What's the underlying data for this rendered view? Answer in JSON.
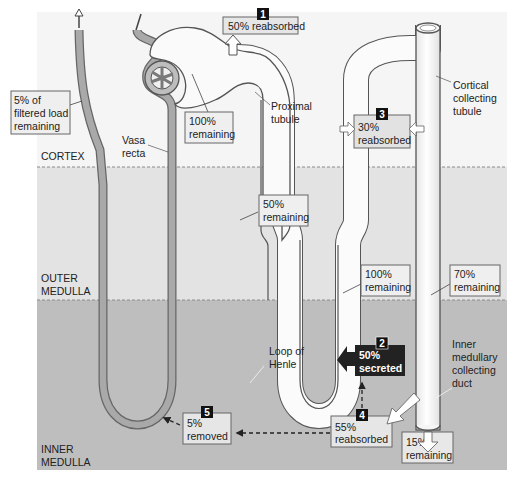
{
  "zones": {
    "cortex": "CORTEX",
    "outer_medulla_1": "OUTER",
    "outer_medulla_2": "MEDULLA",
    "inner_medulla_1": "INNER",
    "inner_medulla_2": "MEDULLA"
  },
  "structure_labels": {
    "vasa_recta_1": "Vasa",
    "vasa_recta_2": "recta",
    "proximal_tubule_1": "Proximal",
    "proximal_tubule_2": "tubule",
    "cortical_collecting_1": "Cortical",
    "cortical_collecting_2": "collecting",
    "cortical_collecting_3": "tubule",
    "loop_of_henle_1": "Loop of",
    "loop_of_henle_2": "Henle",
    "inner_medullary_1": "Inner",
    "inner_medullary_2": "medullary",
    "inner_medullary_3": "collecting",
    "inner_medullary_4": "duct"
  },
  "callouts": {
    "filtered_load_1": "5% of",
    "filtered_load_2": "filtered load",
    "filtered_load_3": "remaining",
    "glomerulus_1": "100%",
    "glomerulus_2": "remaining",
    "proximal_50_1": "50%",
    "proximal_50_2": "remaining",
    "loop_100_1": "100%",
    "loop_100_2": "remaining",
    "collecting_70_1": "70%",
    "collecting_70_2": "remaining",
    "final_15_1": "15%",
    "final_15_2": "remaining"
  },
  "steps": [
    {
      "number": "1",
      "line1": "50% reabsorbed",
      "line2": ""
    },
    {
      "number": "2",
      "line1": "50%",
      "line2": "secreted"
    },
    {
      "number": "3",
      "line1": "30%",
      "line2": "reabsorbed"
    },
    {
      "number": "4",
      "line1": "55%",
      "line2": "reabsorbed"
    },
    {
      "number": "5",
      "line1": "5%",
      "line2": "removed"
    }
  ],
  "colors": {
    "cortex_bg": "#f4f4f4",
    "outer_medulla_bg": "#e4e4e4",
    "inner_medulla_bg": "#bdbdbd",
    "tubule_fill": "#fafafa",
    "vessel_fill": "#a8a8a8",
    "label_box": "#e8e8e8",
    "step_badge": "#1a1a1a"
  }
}
